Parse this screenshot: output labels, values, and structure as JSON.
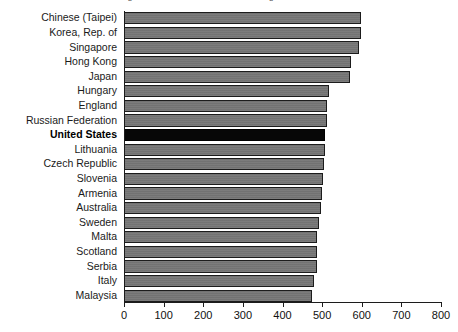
{
  "chart_data": {
    "type": "bar",
    "orientation": "horizontal",
    "title": "Average Mathematics Achievement of Eighth-Grade Students",
    "xlabel": "",
    "ylabel": "",
    "xlim": [
      0,
      800
    ],
    "xticks": [
      0,
      100,
      200,
      300,
      400,
      500,
      600,
      700,
      800
    ],
    "xtick_labels": [
      "0",
      "100",
      "200",
      "300",
      "400",
      "500",
      "600",
      "700",
      "800"
    ],
    "grid": false,
    "legend": "none",
    "highlight_category": "United States",
    "categories": [
      "Chinese (Taipei)",
      "Korea, Rep. of",
      "Singapore",
      "Hong Kong",
      "Japan",
      "Hungary",
      "England",
      "Russian Federation",
      "United States",
      "Lithuania",
      "Czech Republic",
      "Slovenia",
      "Armenia",
      "Australia",
      "Sweden",
      "Malta",
      "Scotland",
      "Serbia",
      "Italy",
      "Malaysia"
    ],
    "values": [
      598,
      597,
      593,
      572,
      570,
      517,
      513,
      512,
      508,
      506,
      504,
      501,
      499,
      496,
      491,
      488,
      487,
      486,
      480,
      474
    ]
  },
  "colors": {
    "bar_fill": "#767676",
    "bar_border": "#1c1c1c",
    "highlight_fill": "#070707",
    "axis": "#1c1c1c",
    "background": "#ffffff",
    "label_text": "#1a1a1a"
  }
}
